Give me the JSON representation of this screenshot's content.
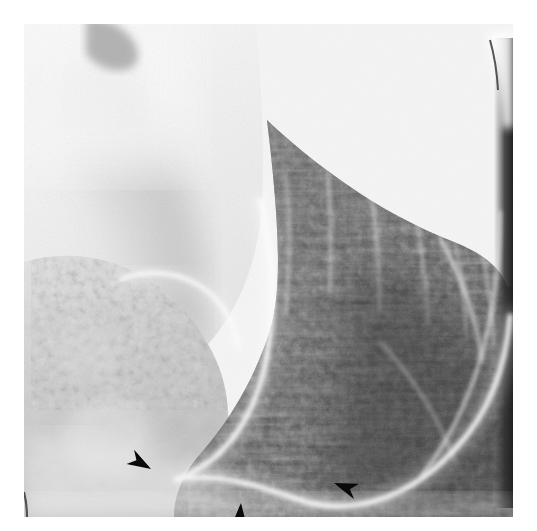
{
  "figure": {
    "kind": "medical-radiograph",
    "modality": "Double-contrast barium upper gastrointestinal radiograph",
    "region": "Stomach — antrum, body and greater curvature",
    "orientation": "Oblique projection, greater curvature along lower border",
    "caption": ""
  },
  "film": {
    "x": 24,
    "y": 24,
    "width": 489,
    "height": 493,
    "background_hex": "#f4f4f4",
    "border": "none"
  },
  "tones": {
    "paper_white_hex": "#ffffff",
    "barium_pool_hex": "#fcfcfc",
    "lumen_light_hex": "#e2e2e2",
    "soft_shadow_hex": "#c9c9c9",
    "midtone_hex": "#9a9a9a",
    "mucosa_dark_hex": "#555555",
    "mucosa_darkest_hex": "#2e2e2e",
    "coating_line_hex": "#fbfbfb",
    "arrow_hex": "#0a0a0a"
  },
  "anatomy": [
    {
      "name": "gastric-air-lumen",
      "label": "Gas-distended lumen (light upper-left field)",
      "tone": "light"
    },
    {
      "name": "greater-curvature-coating",
      "label": "Barium-coated greater curvature (bright white arc)",
      "tone": "bright"
    },
    {
      "name": "incisura-angularis",
      "label": "Incisura angularis notch",
      "tone": "bright"
    },
    {
      "name": "rugal-folds",
      "label": "Rugal folds of gastric body (dark granular field, right)",
      "tone": "dark"
    },
    {
      "name": "antrum",
      "label": "Gastric antrum (left lower field)",
      "tone": "mid"
    },
    {
      "name": "areae-gastricae",
      "label": "Areae gastricae fine mucosal pattern",
      "tone": "mottled"
    }
  ],
  "markers": {
    "type": "arrowhead",
    "count": 3,
    "color_hex": "#0a0a0a",
    "meaning": "Arrowheads indicate the lesion along the greater curvature",
    "items": [
      {
        "id": "arrowhead-1",
        "x": 151,
        "y": 469,
        "rotation_deg": 28,
        "size": 1.0,
        "points_toward": "down-right"
      },
      {
        "id": "arrowhead-2",
        "x": 241,
        "y": 503,
        "rotation_deg": -88,
        "size": 1.05,
        "points_toward": "up"
      },
      {
        "id": "arrowhead-3",
        "x": 334,
        "y": 483,
        "rotation_deg": 198,
        "size": 1.0,
        "points_toward": "up-left"
      }
    ]
  },
  "artifacts": [
    {
      "id": "edge-tick-mark",
      "label": "Film edge tick mark",
      "x": 23,
      "y": 492,
      "width": 3,
      "height": 24
    },
    {
      "id": "top-notch",
      "label": "Dark notch at superior film edge",
      "x": 86,
      "y": 24,
      "width": 54,
      "height": 18
    },
    {
      "id": "right-band",
      "label": "Dense vertical band at right film edge",
      "x": 500,
      "y": 38,
      "width": 13,
      "height": 470
    }
  ]
}
